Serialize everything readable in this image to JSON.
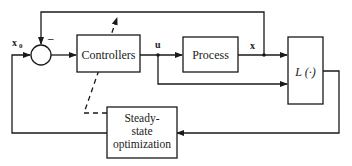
{
  "diagram": {
    "type": "block-diagram",
    "blocks": {
      "controllers": {
        "label": "Controllers"
      },
      "process": {
        "label": "Process"
      },
      "loss": {
        "label": "L (·)"
      },
      "optimizer": {
        "line1": "Steady-",
        "line2": "state",
        "line3": "optimization"
      }
    },
    "signals": {
      "setpoint": "x",
      "setpoint_sub": "0",
      "control": "u",
      "state": "x",
      "feedback_sign": "–"
    },
    "colors": {
      "line": "#1a1a1a",
      "background": "#ffffff"
    }
  }
}
